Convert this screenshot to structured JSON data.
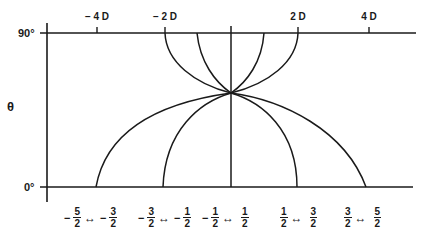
{
  "diagram": {
    "y_axis_label": "θ",
    "y_top_label": "90°",
    "y_bottom_label": "0°",
    "top_axis_ticks": [
      {
        "label": "− 4 D",
        "x": 97
      },
      {
        "label": "− 2 D",
        "x": 165
      },
      {
        "label": "2 D",
        "x": 298
      },
      {
        "label": "4 D",
        "x": 369
      }
    ],
    "convergence_point": {
      "x": 231,
      "y": 93
    },
    "top_axis_y": 33,
    "bottom_axis_y": 187,
    "upper_curve_endpoints_x": [
      165,
      197,
      231,
      264,
      298
    ],
    "lower_curve_endpoints_x": [
      96,
      163,
      230,
      297,
      366
    ],
    "transitions": [
      {
        "from_sign": "−",
        "from_num": "5",
        "from_den": "2",
        "arrow": "↔",
        "to_sign": "−",
        "to_num": "3",
        "to_den": "2"
      },
      {
        "from_sign": "−",
        "from_num": "3",
        "from_den": "2",
        "arrow": "↔",
        "to_sign": "−",
        "to_num": "1",
        "to_den": "2"
      },
      {
        "from_sign": "−",
        "from_num": "1",
        "from_den": "2",
        "arrow": "↔",
        "to_sign": "",
        "to_num": "1",
        "to_den": "2"
      },
      {
        "from_sign": "",
        "from_num": "1",
        "from_den": "2",
        "arrow": "↔",
        "to_sign": "",
        "to_num": "3",
        "to_den": "2"
      },
      {
        "from_sign": "",
        "from_num": "3",
        "from_den": "2",
        "arrow": "↔",
        "to_sign": "",
        "to_num": "5",
        "to_den": "2"
      }
    ],
    "colors": {
      "ink": "#1a1a1a",
      "background": "#ffffff"
    }
  }
}
